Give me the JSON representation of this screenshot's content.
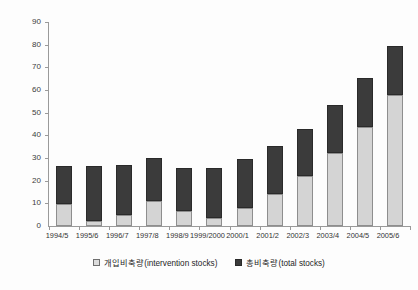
{
  "chart_data": {
    "type": "bar",
    "subtype": "stacked-bar",
    "title": "",
    "xlabel": "",
    "ylabel": "(단위: 백만M/T)",
    "ylim": [
      0,
      90
    ],
    "ytick_step": 10,
    "yticks": [
      0,
      10,
      20,
      30,
      40,
      50,
      60,
      70,
      80,
      90
    ],
    "grid": false,
    "legend_position": "bottom-center",
    "categories": [
      "1994/5",
      "1995/6",
      "1996/7",
      "1997/8",
      "1998/9",
      "1999/2000",
      "2000/1",
      "2001/2",
      "2002/3",
      "2003/4",
      "2004/5",
      "2005/6"
    ],
    "series": [
      {
        "name": "개입비축량(intervention stocks)",
        "color": "#d4d4d4",
        "values": [
          9.5,
          2.0,
          5.0,
          11.0,
          6.5,
          3.5,
          8.0,
          14.0,
          22.0,
          32.0,
          43.5,
          58.0
        ]
      },
      {
        "name": "총비축량(total stocks)",
        "color": "#3b3b3b",
        "values": [
          26.5,
          26.5,
          27.0,
          30.0,
          25.5,
          25.5,
          29.5,
          35.5,
          43.0,
          53.5,
          65.5,
          79.5
        ]
      }
    ]
  },
  "legend": {
    "items": [
      {
        "label": "개입비축량(intervention stocks)",
        "swatch": "light"
      },
      {
        "label": "총비축량(total stocks)",
        "swatch": "dark"
      }
    ]
  }
}
